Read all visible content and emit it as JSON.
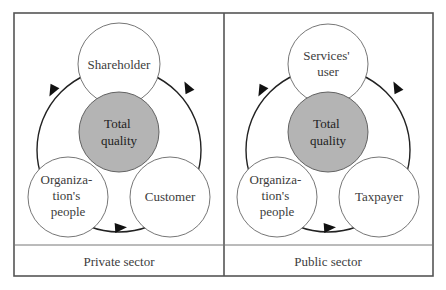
{
  "diagram": {
    "colors": {
      "frame": "#555555",
      "core_fill": "#b4b4b4",
      "node_fill": "#ffffff",
      "ring": "#222222",
      "text": "#3c3c3c"
    },
    "panels": [
      {
        "id": "private",
        "footer": "Private sector",
        "center": {
          "label_lines": [
            "Total",
            "quality"
          ]
        },
        "top": {
          "label_lines": [
            "Shareholder"
          ]
        },
        "bottom_left": {
          "label_lines": [
            "Organiza-",
            "tion's",
            "people"
          ]
        },
        "bottom_right": {
          "label_lines": [
            "Customer"
          ]
        }
      },
      {
        "id": "public",
        "footer": "Public sector",
        "center": {
          "label_lines": [
            "Total",
            "quality"
          ]
        },
        "top": {
          "label_lines": [
            "Services'",
            "user"
          ]
        },
        "bottom_left": {
          "label_lines": [
            "Organiza-",
            "tion's",
            "people"
          ]
        },
        "bottom_right": {
          "label_lines": [
            "Taxpayer"
          ]
        }
      }
    ],
    "cycle_direction": "top -> bottom_left -> bottom_right -> top"
  }
}
